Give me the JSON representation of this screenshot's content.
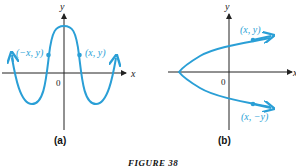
{
  "figure": {
    "caption": "FIGURE 38",
    "panel_a": {
      "label": "(a)",
      "x_axis": "x",
      "y_axis": "y",
      "origin": "0",
      "point_left": "(−x, y)",
      "point_right": "(x, y)"
    },
    "panel_b": {
      "label": "(b)",
      "x_axis": "x",
      "y_axis": "y",
      "origin": "0",
      "point_top": "(x, y)",
      "point_bottom": "(x, −y)"
    },
    "colors": {
      "curve": "#2a9fd6",
      "axis": "#222222"
    }
  }
}
